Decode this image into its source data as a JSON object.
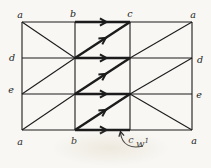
{
  "figure": {
    "canvas": {
      "width": 211,
      "height": 168
    },
    "colors": {
      "ink": "#1c1c1c",
      "paper": "#f8f7f4"
    },
    "grid": {
      "columns_x": [
        22,
        75,
        130,
        192
      ],
      "rows_y": [
        22,
        58,
        94,
        130
      ]
    },
    "vertex_labels": [
      {
        "id": "a-top-left",
        "text": "a",
        "x": 20,
        "y": 18
      },
      {
        "id": "b-top",
        "text": "b",
        "x": 73,
        "y": 17
      },
      {
        "id": "c-top",
        "text": "c",
        "x": 130,
        "y": 17
      },
      {
        "id": "a-top-right",
        "text": "a",
        "x": 193,
        "y": 18
      },
      {
        "id": "d-left",
        "text": "d",
        "x": 12,
        "y": 61
      },
      {
        "id": "d-right",
        "text": "d",
        "x": 200,
        "y": 63
      },
      {
        "id": "e-left",
        "text": "e",
        "x": 11,
        "y": 93
      },
      {
        "id": "e-right",
        "text": "e",
        "x": 199,
        "y": 98
      },
      {
        "id": "a-bottom-left",
        "text": "a",
        "x": 20,
        "y": 145
      },
      {
        "id": "b-bottom",
        "text": "b",
        "x": 74,
        "y": 144
      },
      {
        "id": "c-bottom",
        "text": "c",
        "x": 131,
        "y": 143
      },
      {
        "id": "a-bottom-right",
        "text": "a",
        "x": 194,
        "y": 144
      }
    ],
    "thin_edges": [
      {
        "id": "top-a-b",
        "pts": [
          22,
          22,
          75,
          22
        ]
      },
      {
        "id": "top-c-a",
        "pts": [
          130,
          22,
          192,
          22
        ]
      },
      {
        "id": "bottom-a-b",
        "pts": [
          22,
          130,
          75,
          130
        ]
      },
      {
        "id": "bottom-c-a",
        "pts": [
          130,
          130,
          192,
          130
        ]
      },
      {
        "id": "left-side",
        "pts": [
          22,
          22,
          22,
          130
        ]
      },
      {
        "id": "right-side",
        "pts": [
          192,
          22,
          192,
          130
        ]
      },
      {
        "id": "vertical-b",
        "pts": [
          75,
          22,
          75,
          130
        ]
      },
      {
        "id": "vertical-c",
        "pts": [
          130,
          22,
          130,
          130
        ]
      },
      {
        "id": "d-row-left",
        "pts": [
          22,
          58,
          75,
          58
        ]
      },
      {
        "id": "d-row-right",
        "pts": [
          130,
          58,
          192,
          58
        ]
      },
      {
        "id": "e-row-left",
        "pts": [
          22,
          94,
          75,
          94
        ]
      },
      {
        "id": "e-row-right",
        "pts": [
          130,
          94,
          192,
          94
        ]
      },
      {
        "id": "diag-left-top",
        "pts": [
          22,
          22,
          75,
          58
        ]
      },
      {
        "id": "diag-left-mid",
        "pts": [
          22,
          94,
          75,
          58
        ]
      },
      {
        "id": "diag-left-bottom",
        "pts": [
          22,
          130,
          75,
          94
        ]
      },
      {
        "id": "diag-right-top",
        "pts": [
          130,
          58,
          192,
          22
        ]
      },
      {
        "id": "diag-right-mid",
        "pts": [
          130,
          94,
          192,
          58
        ]
      },
      {
        "id": "diag-right-bottom",
        "pts": [
          130,
          94,
          192,
          130
        ]
      }
    ],
    "bold_arrow_edges": [
      {
        "id": "w-top-b-c",
        "pts": [
          75,
          22,
          130,
          22
        ]
      },
      {
        "id": "w-diag-top",
        "pts": [
          75,
          58,
          130,
          22
        ]
      },
      {
        "id": "w-d-row-b-c",
        "pts": [
          75,
          58,
          130,
          58
        ]
      },
      {
        "id": "w-diag-mid",
        "pts": [
          75,
          94,
          130,
          58
        ]
      },
      {
        "id": "w-e-row-b-c",
        "pts": [
          75,
          94,
          130,
          94
        ]
      },
      {
        "id": "w-diag-bottom",
        "pts": [
          75,
          130,
          130,
          94
        ]
      },
      {
        "id": "w-bottom-b-c",
        "pts": [
          75,
          130,
          130,
          130
        ]
      }
    ],
    "annotation": {
      "label": "w",
      "superscript": "1",
      "x": 136,
      "y": 147,
      "pointer_curve": "M 143 146 C 131 149 122 145 120.5 133",
      "pointer_tip": {
        "x": 120.5,
        "y": 131.5,
        "angle_deg": -102
      }
    }
  }
}
